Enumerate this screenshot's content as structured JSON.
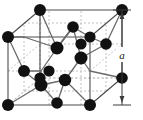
{
  "figure": {
    "name": "diamond-cubic-unit-cell",
    "background_color": "#ffffff",
    "atom_color": "#111111",
    "solid_edge_color": "#4d4d4d",
    "hidden_edge_color": "#9a9a9a",
    "bond_color": "#6b6b6b",
    "dimension_color": "#3a3a3a"
  },
  "dimension": {
    "label": "a",
    "axis": "vertical",
    "x": 120,
    "y_top": 10,
    "y_bottom": 105,
    "tick_half_width": 7
  },
  "geometry": {
    "front_face": {
      "left": 8,
      "right": 90,
      "top": 37,
      "bottom": 105
    },
    "depth_offset": {
      "dx": 32,
      "dy": -27
    }
  },
  "atoms": {
    "corner_count": 8,
    "face_center_count": 6,
    "interior_count": 4,
    "radius_corner": 6,
    "radius_face": 6,
    "radius_interior": 6.5
  }
}
